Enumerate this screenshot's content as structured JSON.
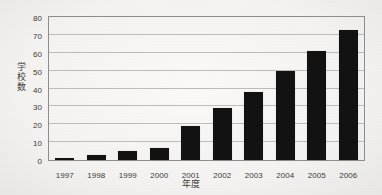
{
  "chart_data": {
    "type": "bar",
    "title": "",
    "subtitle": "",
    "xlabel": "年度",
    "ylabel": "学校数",
    "categories": [
      "1997",
      "1998",
      "1999",
      "2000",
      "2001",
      "2002",
      "2003",
      "2004",
      "2005",
      "2006"
    ],
    "values": [
      1,
      3,
      5,
      7,
      19,
      29,
      38,
      50,
      61,
      73
    ],
    "series": [
      {
        "name": "学校数",
        "values": [
          1,
          3,
          5,
          7,
          19,
          29,
          38,
          50,
          61,
          73
        ]
      }
    ],
    "ylim": [
      0,
      80
    ],
    "ytick_values": [
      0,
      10,
      20,
      30,
      40,
      50,
      60,
      70,
      80
    ],
    "ytick_labels": [
      "0",
      "10",
      "20",
      "30",
      "40",
      "50",
      "60",
      "70",
      "80"
    ],
    "ytick_step": 10,
    "xtick_labels": [
      "1997",
      "1998",
      "1999",
      "2000",
      "2001",
      "2002",
      "2003",
      "2004",
      "2005",
      "2006"
    ],
    "grid": "horizontal",
    "legend": "none",
    "annotations": [],
    "colors": {
      "bar": "#121212",
      "gridline": "#bdbcb9",
      "axis": "#8e8d8a",
      "text": "#3a3a3a",
      "background": "#f4f3f1"
    }
  },
  "figure": {
    "y_axis_title_vertical": "学\n校\n数",
    "x_axis_title": "年度"
  }
}
